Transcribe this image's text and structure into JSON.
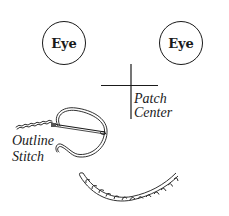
{
  "diagram": {
    "eyes": [
      {
        "label": "Eye",
        "position": "left"
      },
      {
        "label": "Eye",
        "position": "right"
      }
    ],
    "patch_center": {
      "line1": "Patch",
      "line2": "Center",
      "icon": "crosshair-icon"
    },
    "outline_stitch": {
      "line1": "Outline",
      "line2": "Stitch",
      "icon": "needle-thread-icon"
    },
    "mouth": {
      "icon": "twisted-rope-smile-icon"
    },
    "colors": {
      "stroke": "#1a1a1a",
      "background": "#ffffff"
    }
  }
}
